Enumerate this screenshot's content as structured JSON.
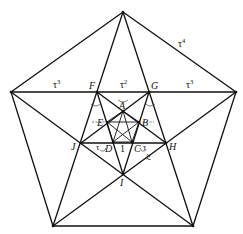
{
  "diagram": {
    "points": {
      "T": [
        123,
        12
      ],
      "L": [
        11,
        92
      ],
      "R": [
        236,
        92
      ],
      "BL": [
        53,
        226
      ],
      "BR": [
        193,
        226
      ],
      "F": [
        97,
        92
      ],
      "G": [
        149,
        92
      ],
      "H": [
        166,
        143
      ],
      "I": [
        123,
        174
      ],
      "J": [
        81,
        143
      ],
      "A": [
        123,
        111
      ],
      "B": [
        139,
        122
      ],
      "C": [
        132,
        142
      ],
      "D": [
        113,
        142
      ],
      "E": [
        107,
        122
      ]
    },
    "vertex_labels": {
      "A": "A",
      "B": "B",
      "C": "C",
      "D": "D",
      "E": "E",
      "F": "F",
      "G": "G",
      "H": "H",
      "I": "I",
      "J": "J"
    },
    "segment_labels": {
      "outer_edge": {
        "base": "τ",
        "exp": "4"
      },
      "left_top": {
        "base": "τ",
        "exp": "3"
      },
      "middle_top": {
        "base": "τ",
        "exp": "2"
      },
      "right_top": {
        "base": "τ",
        "exp": "3"
      },
      "inner_unit": "1",
      "tau_left": "τ",
      "tau_right": "τ",
      "tau_squared_slanted": "τ²"
    },
    "colors": {
      "line": "#111111",
      "background": "#ffffff"
    }
  }
}
